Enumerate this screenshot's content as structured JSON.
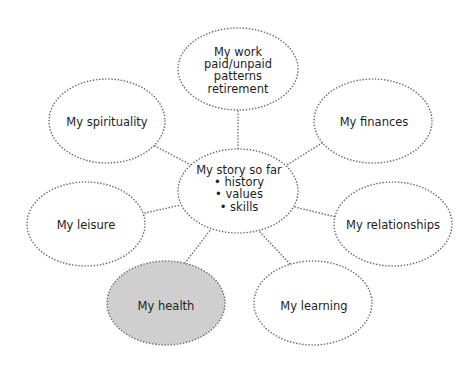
{
  "diagram": {
    "type": "mind-map",
    "colors": {
      "outline": "#6f6f6f",
      "highlight_fill": "#cfcfcf",
      "default_fill": "#ffffff",
      "text": "#1e1e1e"
    },
    "center": {
      "id": "story",
      "lines": [
        "My story so far",
        "• history",
        "• values",
        "• skills"
      ]
    },
    "nodes": [
      {
        "id": "work",
        "lines": [
          "My work",
          "paid/unpaid",
          "patterns",
          "retirement"
        ],
        "highlighted": false
      },
      {
        "id": "spirituality",
        "lines": [
          "My spirituality"
        ],
        "highlighted": false
      },
      {
        "id": "finances",
        "lines": [
          "My finances"
        ],
        "highlighted": false
      },
      {
        "id": "leisure",
        "lines": [
          "My leisure"
        ],
        "highlighted": false
      },
      {
        "id": "relationships",
        "lines": [
          "My relationships"
        ],
        "highlighted": false
      },
      {
        "id": "health",
        "lines": [
          "My health"
        ],
        "highlighted": true
      },
      {
        "id": "learning",
        "lines": [
          "My learning"
        ],
        "highlighted": false
      }
    ],
    "edges": [
      [
        "work",
        "story"
      ],
      [
        "spirituality",
        "story"
      ],
      [
        "finances",
        "story"
      ],
      [
        "leisure",
        "story"
      ],
      [
        "relationships",
        "story"
      ],
      [
        "health",
        "story"
      ],
      [
        "learning",
        "story"
      ]
    ]
  }
}
